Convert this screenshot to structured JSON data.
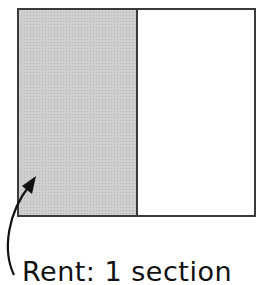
{
  "diagram": {
    "type": "fraction-bar",
    "sections_total": 2,
    "shaded_sections": 1,
    "shaded_color": "#c8c8c8",
    "border_color": "#333333",
    "label": "Rent: 1 section"
  }
}
